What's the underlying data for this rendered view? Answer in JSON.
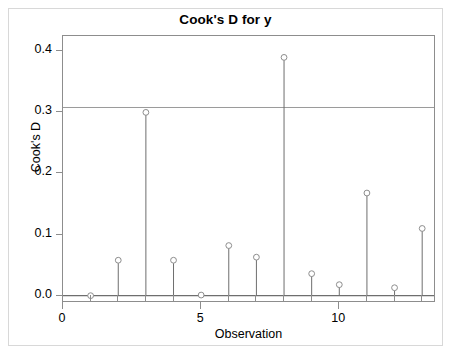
{
  "chart_data": {
    "type": "scatter",
    "title": "Cook's D for y",
    "xlabel": "Observation",
    "ylabel": "Cook's D",
    "x": [
      1,
      2,
      3,
      4,
      5,
      6,
      7,
      8,
      9,
      10,
      11,
      12,
      13
    ],
    "values": [
      0.0,
      0.058,
      0.3,
      0.058,
      0.001,
      0.082,
      0.063,
      0.39,
      0.036,
      0.018,
      0.168,
      0.013,
      0.11
    ],
    "categories": [
      "1",
      "2",
      "3",
      "4",
      "5",
      "6",
      "7",
      "8",
      "9",
      "10",
      "11",
      "12",
      "13"
    ],
    "xlim": [
      0,
      13.5
    ],
    "ylim": [
      -0.012,
      0.425
    ],
    "xticks": [
      0,
      5,
      10
    ],
    "xtick_labels": [
      "0",
      "5",
      "10"
    ],
    "xminor_ticks": [
      1,
      2,
      3,
      4,
      6,
      7,
      8,
      9,
      11,
      12,
      13
    ],
    "yticks": [
      0.0,
      0.1,
      0.2,
      0.3,
      0.4
    ],
    "ytick_labels": [
      "0.0",
      "0.1",
      "0.2",
      "0.3",
      "0.4"
    ],
    "grid": false,
    "legend": null,
    "marker": "open-circle",
    "stem_baseline": 0.0,
    "reference_line": {
      "name": "cutoff",
      "orientation": "horizontal",
      "value": 0.308,
      "color": "#9a9a9a"
    },
    "colors": {
      "marker_edge": "#8d8d8d",
      "stem": "#6e6e6e",
      "axis": "#8d8d8d",
      "baseline": "#6e6e6e",
      "text": "#000000",
      "frame": "#d8d8d8",
      "background": "#ffffff"
    }
  }
}
